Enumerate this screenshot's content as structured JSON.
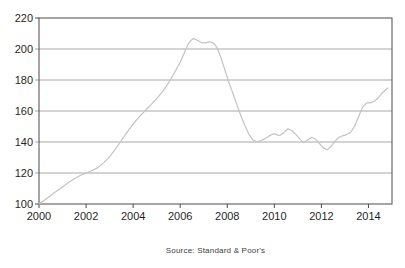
{
  "page": {
    "background": "#ffffff"
  },
  "chart_data": {
    "type": "line",
    "title": "",
    "xlabel": "",
    "ylabel": "",
    "legend": "none",
    "grid": "horizontal",
    "source_note": "Source: Standard & Poor's",
    "xlim": [
      2000,
      2015
    ],
    "ylim": [
      100,
      220
    ],
    "x_ticks": [
      2000,
      2002,
      2004,
      2006,
      2008,
      2010,
      2012,
      2014
    ],
    "x_tick_labels": [
      "2000",
      "2002",
      "2004",
      "2006",
      "2008",
      "2010",
      "2012",
      "2014"
    ],
    "y_ticks": [
      100,
      120,
      140,
      160,
      180,
      200,
      220
    ],
    "y_tick_labels": [
      "100",
      "120",
      "140",
      "160",
      "180",
      "200",
      "220"
    ],
    "colors": {
      "line": "#c3c3c3",
      "grid": "#a8a8a8",
      "axis": "#4a4a4a",
      "text": "#1f1f1f"
    },
    "series": [
      {
        "name": "",
        "x": [
          2000.0,
          2000.25,
          2000.5,
          2000.75,
          2001.0,
          2001.25,
          2001.5,
          2001.75,
          2002.0,
          2002.25,
          2002.5,
          2002.75,
          2003.0,
          2003.25,
          2003.5,
          2003.75,
          2004.0,
          2004.25,
          2004.5,
          2004.75,
          2005.0,
          2005.25,
          2005.5,
          2005.75,
          2006.0,
          2006.17,
          2006.33,
          2006.5,
          2006.58,
          2006.75,
          2006.92,
          2007.08,
          2007.25,
          2007.42,
          2007.58,
          2007.75,
          2007.92,
          2008.08,
          2008.25,
          2008.42,
          2008.58,
          2008.75,
          2008.92,
          2009.08,
          2009.25,
          2009.42,
          2009.58,
          2009.75,
          2009.92,
          2010.0,
          2010.08,
          2010.17,
          2010.25,
          2010.42,
          2010.58,
          2010.75,
          2010.92,
          2011.08,
          2011.25,
          2011.42,
          2011.58,
          2011.75,
          2011.92,
          2012.08,
          2012.25,
          2012.42,
          2012.58,
          2012.75,
          2012.92,
          2013.08,
          2013.25,
          2013.42,
          2013.58,
          2013.75,
          2013.92,
          2014.08,
          2014.25,
          2014.42,
          2014.58,
          2014.75,
          2014.83
        ],
        "values": [
          100.0,
          102.8,
          105.5,
          108.3,
          111.0,
          113.8,
          116.3,
          118.4,
          120.0,
          121.5,
          123.5,
          126.5,
          130.5,
          135.5,
          141.0,
          146.5,
          151.5,
          156.0,
          160.0,
          164.0,
          168.0,
          172.5,
          178.0,
          184.5,
          191.5,
          197.5,
          203.0,
          206.2,
          206.7,
          205.5,
          204.0,
          204.0,
          204.7,
          203.8,
          200.5,
          193.5,
          185.5,
          178.0,
          171.0,
          163.5,
          157.0,
          150.5,
          145.0,
          141.5,
          140.2,
          140.8,
          142.0,
          143.6,
          145.0,
          145.3,
          144.9,
          144.2,
          144.4,
          146.3,
          148.6,
          147.3,
          144.8,
          142.0,
          139.6,
          141.2,
          143.0,
          141.8,
          139.0,
          136.2,
          135.0,
          137.2,
          140.6,
          143.0,
          144.1,
          144.8,
          146.3,
          150.5,
          156.5,
          162.5,
          165.2,
          165.2,
          166.3,
          168.6,
          171.5,
          174.0,
          174.8
        ]
      }
    ]
  }
}
